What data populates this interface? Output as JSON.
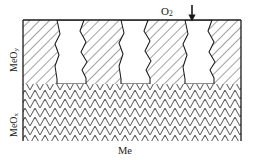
{
  "figure": {
    "gas": {
      "label_text": "O",
      "label_sub": "2",
      "arrow_icon": "arrow-down-icon"
    },
    "layers": [
      {
        "id": "outer-oxide",
        "label_text": "MeO",
        "label_sub": "y",
        "hatch": "diagonal",
        "description": "outer oxide scale with columnar voids"
      },
      {
        "id": "inner-oxide",
        "label_text": "MeO",
        "label_sub": "x",
        "hatch": "chevron",
        "description": "inner oxide layer with zigzag hatching"
      },
      {
        "id": "substrate",
        "label_text": "Me",
        "hatch": "none",
        "description": "metal substrate"
      }
    ],
    "voids": [
      {
        "id": "void-1",
        "x_center": 71
      },
      {
        "id": "void-2",
        "x_center": 135
      },
      {
        "id": "void-3",
        "x_center": 199
      }
    ],
    "colors": {
      "line": "#1a1a1a",
      "hatch": "#555555",
      "void_fill": "#ffffff",
      "background": "#ffffff"
    },
    "geometry": {
      "frame_left": 23,
      "frame_right": 241,
      "frame_top": 20,
      "boundary_y": 84,
      "frame_bottom": 141
    }
  }
}
